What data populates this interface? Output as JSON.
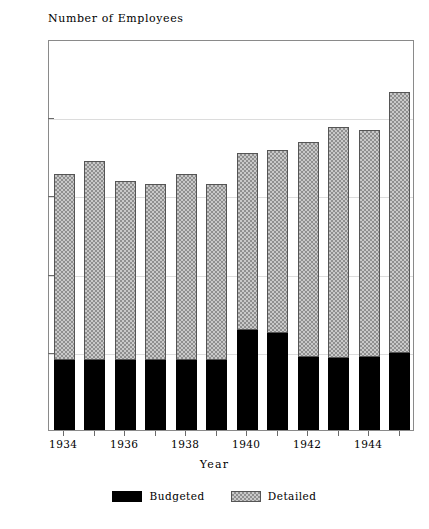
{
  "chart_data": {
    "type": "bar",
    "stacked": true,
    "title": "Number of Employees",
    "xlabel": "Year",
    "ylabel": "",
    "categories": [
      "1934",
      "1935",
      "1936",
      "1937",
      "1938",
      "1939",
      "1940",
      "1941",
      "1942",
      "1943",
      "1944",
      "1945"
    ],
    "x_tick_labels": [
      "1934",
      "1936",
      "1938",
      "1940",
      "1942",
      "1944"
    ],
    "x_tick_label_indices": [
      0,
      2,
      4,
      6,
      8,
      10
    ],
    "y_tick_labels": [
      "0",
      "50",
      "100",
      "150",
      "200",
      "250"
    ],
    "y_ticks": [
      0,
      50,
      100,
      150,
      200,
      250
    ],
    "ylim": [
      0,
      250
    ],
    "grid": "horizontal",
    "legend_position": "bottom-center",
    "series": [
      {
        "name": "Budgeted",
        "color": "#000000",
        "pattern": "solid",
        "values": [
          45,
          45,
          45,
          45,
          45,
          45,
          64,
          62,
          47,
          46,
          47,
          49
        ]
      },
      {
        "name": "Detailed",
        "color": "#c9c9c9",
        "pattern": "hatched",
        "values": [
          119,
          127,
          114,
          112,
          119,
          112,
          113,
          117,
          137,
          148,
          145,
          167
        ]
      }
    ],
    "totals": [
      164,
      172,
      159,
      157,
      164,
      157,
      177,
      179,
      184,
      194,
      192,
      216
    ]
  }
}
